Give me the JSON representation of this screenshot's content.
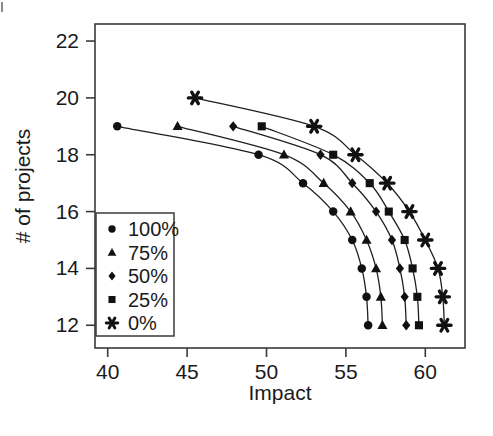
{
  "chart_data": {
    "type": "line",
    "title": "",
    "subtitle": "",
    "xlabel": "Impact",
    "ylabel": "# of projects",
    "xlim": [
      39.2,
      62.5
    ],
    "ylim": [
      11.2,
      22.6
    ],
    "xticks": [
      40,
      45,
      50,
      55,
      60
    ],
    "yticks": [
      12,
      14,
      16,
      18,
      20,
      22
    ],
    "grid": false,
    "legend_position": "lower-left-inside",
    "marker_style_note": "each series uses a distinct filled marker glyph",
    "series": [
      {
        "name": "100%",
        "marker": "circle",
        "points": [
          [
            40.6,
            19
          ],
          [
            49.5,
            18
          ],
          [
            52.3,
            17
          ],
          [
            54.2,
            16
          ],
          [
            55.4,
            15
          ],
          [
            56.0,
            14
          ],
          [
            56.3,
            13
          ],
          [
            56.4,
            12
          ]
        ]
      },
      {
        "name": "75%",
        "marker": "triangle",
        "points": [
          [
            44.4,
            19
          ],
          [
            51.1,
            18
          ],
          [
            53.6,
            17
          ],
          [
            55.3,
            16
          ],
          [
            56.3,
            15
          ],
          [
            56.9,
            14
          ],
          [
            57.2,
            13
          ],
          [
            57.3,
            12
          ]
        ]
      },
      {
        "name": "50%",
        "marker": "diamond",
        "points": [
          [
            47.9,
            19
          ],
          [
            53.4,
            18
          ],
          [
            55.4,
            17
          ],
          [
            56.9,
            16
          ],
          [
            57.9,
            15
          ],
          [
            58.4,
            14
          ],
          [
            58.7,
            13
          ],
          [
            58.8,
            12
          ]
        ]
      },
      {
        "name": "25%",
        "marker": "square",
        "points": [
          [
            49.7,
            19
          ],
          [
            54.2,
            18
          ],
          [
            56.5,
            17
          ],
          [
            57.7,
            16
          ],
          [
            58.7,
            15
          ],
          [
            59.2,
            14
          ],
          [
            59.5,
            13
          ],
          [
            59.6,
            12
          ]
        ]
      },
      {
        "name": "0%",
        "marker": "asterisk",
        "points": [
          [
            45.5,
            20
          ],
          [
            53.0,
            19
          ],
          [
            55.6,
            18
          ],
          [
            57.6,
            17
          ],
          [
            59.0,
            16
          ],
          [
            60.0,
            15
          ],
          [
            60.8,
            14
          ],
          [
            61.1,
            13
          ],
          [
            61.2,
            12
          ]
        ]
      }
    ],
    "legend": [
      {
        "label": "100%",
        "marker": "circle"
      },
      {
        "label": "75%",
        "marker": "triangle"
      },
      {
        "label": "50%",
        "marker": "diamond"
      },
      {
        "label": "25%",
        "marker": "square"
      },
      {
        "label": "0%",
        "marker": "asterisk"
      }
    ]
  },
  "colors": {
    "ink": "#111111",
    "frame": "#3a3a3a",
    "background": "#ffffff"
  }
}
